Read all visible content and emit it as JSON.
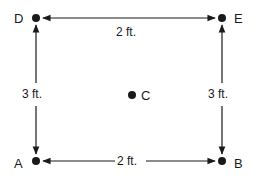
{
  "points": {
    "A": {
      "label": "A"
    },
    "B": {
      "label": "B"
    },
    "C": {
      "label": "C"
    },
    "D": {
      "label": "D"
    },
    "E": {
      "label": "E"
    }
  },
  "dimensions": {
    "top": "2 ft.",
    "bottom": "2 ft.",
    "left": "3 ft.",
    "right": "3 ft."
  },
  "colors": {
    "stroke": "#1a1a1a",
    "background": "#ffffff"
  }
}
